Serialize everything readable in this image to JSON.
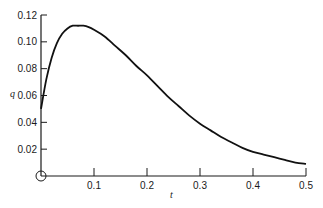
{
  "chart_data": {
    "type": "line",
    "title": "",
    "xlabel": "t",
    "ylabel": "q",
    "xlim": [
      0,
      0.5
    ],
    "ylim": [
      0,
      0.12
    ],
    "grid": false,
    "legend": null,
    "x_ticks": [
      "0.1",
      "0.2",
      "0.3",
      "0.4",
      "0.5"
    ],
    "y_ticks": [
      "0.02",
      "0.04",
      "0.06",
      "0.08",
      "0.10",
      "0.12"
    ],
    "origin_marker": "circle",
    "series": [
      {
        "name": "q(t)",
        "x": [
          0.0,
          0.01,
          0.02,
          0.03,
          0.04,
          0.05,
          0.06,
          0.07,
          0.08,
          0.09,
          0.1,
          0.12,
          0.14,
          0.16,
          0.18,
          0.2,
          0.22,
          0.24,
          0.26,
          0.28,
          0.3,
          0.32,
          0.34,
          0.36,
          0.38,
          0.4,
          0.42,
          0.44,
          0.46,
          0.48,
          0.5
        ],
        "values": [
          0.05,
          0.072,
          0.088,
          0.099,
          0.106,
          0.11,
          0.112,
          0.112,
          0.112,
          0.111,
          0.109,
          0.104,
          0.097,
          0.09,
          0.082,
          0.075,
          0.067,
          0.059,
          0.052,
          0.045,
          0.039,
          0.034,
          0.029,
          0.025,
          0.021,
          0.018,
          0.016,
          0.014,
          0.012,
          0.01,
          0.009
        ]
      }
    ]
  }
}
